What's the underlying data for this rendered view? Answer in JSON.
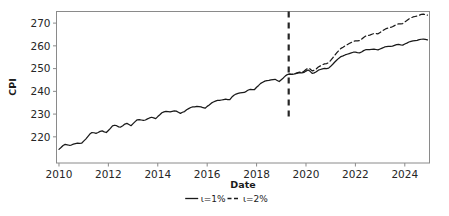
{
  "chart_data": {
    "type": "line",
    "title": "",
    "xlabel": "Date",
    "ylabel": "CPI",
    "xlim": [
      2009.9,
      2025.0
    ],
    "ylim": [
      208.5,
      275.1
    ],
    "xticks": [
      "2010",
      "2012",
      "2014",
      "2016",
      "2018",
      "2020",
      "2022",
      "2024"
    ],
    "xtick_values": [
      2010,
      2012,
      2014,
      2016,
      2018,
      2020,
      2022,
      2024
    ],
    "yticks": [
      "220",
      "230",
      "240",
      "250",
      "260",
      "270"
    ],
    "ytick_values": [
      220,
      230,
      240,
      250,
      260,
      270
    ],
    "grid": false,
    "legend_position": "below-axes",
    "annotations": [
      {
        "name": "forecast-start-line",
        "type": "vline",
        "x": 2019.3,
        "style": "dashed",
        "color": "#262626"
      }
    ],
    "series": [
      {
        "name": "ι=1%",
        "style": "solid",
        "color": "#1a1a1a",
        "x": [
          2010.0,
          2010.083,
          2010.167,
          2010.25,
          2010.333,
          2010.417,
          2010.5,
          2010.583,
          2010.667,
          2010.75,
          2010.833,
          2010.917,
          2011.0,
          2011.083,
          2011.167,
          2011.25,
          2011.333,
          2011.417,
          2011.5,
          2011.583,
          2011.667,
          2011.75,
          2011.833,
          2011.917,
          2012.0,
          2012.083,
          2012.167,
          2012.25,
          2012.333,
          2012.417,
          2012.5,
          2012.583,
          2012.667,
          2012.75,
          2012.833,
          2012.917,
          2013.0,
          2013.083,
          2013.167,
          2013.25,
          2013.333,
          2013.417,
          2013.5,
          2013.583,
          2013.667,
          2013.75,
          2013.833,
          2013.917,
          2014.0,
          2014.083,
          2014.167,
          2014.25,
          2014.333,
          2014.417,
          2014.5,
          2014.583,
          2014.667,
          2014.75,
          2014.833,
          2014.917,
          2015.0,
          2015.083,
          2015.167,
          2015.25,
          2015.333,
          2015.417,
          2015.5,
          2015.583,
          2015.667,
          2015.75,
          2015.833,
          2015.917,
          2016.0,
          2016.083,
          2016.167,
          2016.25,
          2016.333,
          2016.417,
          2016.5,
          2016.583,
          2016.667,
          2016.75,
          2016.833,
          2016.917,
          2017.0,
          2017.083,
          2017.167,
          2017.25,
          2017.333,
          2017.417,
          2017.5,
          2017.583,
          2017.667,
          2017.75,
          2017.833,
          2017.917,
          2018.0,
          2018.083,
          2018.167,
          2018.25,
          2018.333,
          2018.417,
          2018.5,
          2018.583,
          2018.667,
          2018.75,
          2018.833,
          2018.917,
          2019.0,
          2019.083,
          2019.167,
          2019.25,
          2019.333,
          2019.417,
          2019.5,
          2019.583,
          2019.667,
          2019.75,
          2019.833,
          2019.917,
          2020.0,
          2020.083,
          2020.167,
          2020.25,
          2020.333,
          2020.417,
          2020.5,
          2020.583,
          2020.667,
          2020.75,
          2020.833,
          2020.917,
          2021.0,
          2021.083,
          2021.167,
          2021.25,
          2021.333,
          2021.417,
          2021.5,
          2021.583,
          2021.667,
          2021.75,
          2021.833,
          2021.917,
          2022.0,
          2022.083,
          2022.167,
          2022.25,
          2022.333,
          2022.417,
          2022.5,
          2022.583,
          2022.667,
          2022.75,
          2022.833,
          2022.917,
          2023.0,
          2023.083,
          2023.167,
          2023.25,
          2023.333,
          2023.417,
          2023.5,
          2023.583,
          2023.667,
          2023.75,
          2023.833,
          2023.917,
          2024.0,
          2024.083,
          2024.167,
          2024.25,
          2024.333,
          2024.417,
          2024.5,
          2024.583,
          2024.667,
          2024.75,
          2024.833,
          2024.917
        ],
        "values": [
          214.5,
          215.3,
          216.2,
          216.7,
          216.5,
          216.3,
          216.4,
          216.8,
          217.0,
          217.2,
          217.1,
          217.2,
          218.1,
          219.0,
          220.1,
          221.2,
          221.9,
          221.8,
          221.5,
          221.9,
          222.4,
          222.6,
          222.2,
          221.9,
          222.8,
          223.7,
          224.8,
          225.1,
          224.9,
          224.4,
          224.3,
          224.9,
          225.6,
          225.9,
          225.4,
          224.9,
          225.8,
          226.7,
          227.5,
          227.6,
          227.4,
          227.2,
          227.4,
          227.9,
          228.3,
          228.6,
          228.3,
          228.0,
          228.9,
          229.7,
          230.6,
          231.0,
          231.2,
          231.1,
          231.0,
          231.2,
          231.4,
          231.3,
          230.8,
          230.3,
          230.8,
          231.1,
          231.9,
          232.4,
          232.9,
          233.2,
          233.2,
          233.4,
          233.3,
          233.2,
          232.8,
          232.6,
          233.4,
          234.0,
          234.8,
          235.3,
          235.7,
          236.0,
          236.0,
          236.2,
          236.4,
          236.6,
          236.4,
          236.4,
          237.5,
          238.3,
          238.8,
          239.1,
          239.3,
          239.4,
          239.5,
          240.0,
          240.6,
          240.9,
          240.8,
          240.8,
          241.8,
          242.6,
          243.5,
          244.0,
          244.5,
          244.7,
          244.8,
          245.0,
          245.2,
          245.3,
          244.8,
          244.3,
          245.1,
          245.9,
          246.8,
          247.4,
          247.6,
          247.5,
          247.6,
          247.8,
          248.0,
          248.2,
          248.1,
          248.3,
          248.9,
          249.4,
          248.8,
          247.9,
          248.1,
          248.6,
          249.3,
          249.6,
          249.9,
          250.1,
          250.0,
          250.2,
          251.0,
          251.9,
          252.9,
          253.8,
          254.6,
          255.3,
          255.6,
          256.0,
          256.3,
          256.6,
          256.9,
          257.2,
          257.2,
          257.0,
          256.9,
          257.3,
          257.9,
          258.3,
          258.3,
          258.3,
          258.5,
          258.6,
          258.4,
          258.2,
          258.6,
          259.0,
          259.4,
          259.7,
          259.8,
          259.8,
          259.9,
          260.2,
          260.5,
          260.6,
          260.4,
          260.3,
          260.8,
          261.2,
          261.7,
          262.0,
          262.2,
          262.3,
          262.4,
          262.7,
          262.9,
          263.0,
          262.8,
          262.6
        ]
      },
      {
        "name": "ι=2%",
        "style": "dashed",
        "color": "#1a1a1a",
        "x": [
          2019.25,
          2019.333,
          2019.417,
          2019.5,
          2019.583,
          2019.667,
          2019.75,
          2019.833,
          2019.917,
          2020.0,
          2020.083,
          2020.167,
          2020.25,
          2020.333,
          2020.417,
          2020.5,
          2020.583,
          2020.667,
          2020.75,
          2020.833,
          2020.917,
          2021.0,
          2021.083,
          2021.167,
          2021.25,
          2021.333,
          2021.417,
          2021.5,
          2021.583,
          2021.667,
          2021.75,
          2021.833,
          2021.917,
          2022.0,
          2022.083,
          2022.167,
          2022.25,
          2022.333,
          2022.417,
          2022.5,
          2022.583,
          2022.667,
          2022.75,
          2022.833,
          2022.917,
          2023.0,
          2023.083,
          2023.167,
          2023.25,
          2023.333,
          2023.417,
          2023.5,
          2023.583,
          2023.667,
          2023.75,
          2023.833,
          2023.917,
          2024.0,
          2024.083,
          2024.167,
          2024.25,
          2024.333,
          2024.417,
          2024.5,
          2024.583,
          2024.667,
          2024.75,
          2024.833,
          2024.917
        ],
        "values": [
          247.4,
          247.6,
          247.5,
          247.6,
          247.9,
          248.2,
          248.5,
          248.5,
          248.8,
          249.6,
          250.2,
          249.8,
          249.0,
          249.3,
          249.9,
          250.7,
          251.2,
          251.7,
          252.1,
          252.2,
          252.6,
          253.6,
          254.7,
          255.9,
          257.0,
          258.0,
          258.9,
          259.4,
          260.0,
          260.5,
          261.0,
          261.5,
          262.0,
          262.2,
          262.2,
          262.3,
          262.9,
          263.7,
          264.3,
          264.5,
          264.7,
          265.1,
          265.4,
          265.4,
          265.3,
          265.9,
          266.5,
          267.1,
          267.6,
          267.9,
          268.1,
          268.4,
          268.9,
          269.4,
          269.7,
          269.7,
          269.8,
          270.5,
          271.1,
          271.8,
          272.3,
          272.7,
          272.9,
          273.1,
          273.5,
          273.8,
          273.9,
          273.8,
          273.5
        ]
      }
    ],
    "legend": [
      {
        "label": "ι=1%",
        "style": "solid"
      },
      {
        "label": "ι=2%",
        "style": "dashed"
      }
    ]
  },
  "figure": {
    "background_color": "#ffffff",
    "axes_frame_color": "#8a8a8a",
    "line_color": "#1a1a1a"
  }
}
